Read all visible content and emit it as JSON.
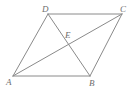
{
  "figure": {
    "kind": "geometry-diagram",
    "background_color": "#ffffff",
    "stroke_color": "#8a8a8a",
    "label_color": "#6e6e6e",
    "stroke_width": 1,
    "width": 135,
    "height": 91
  },
  "points": {
    "A": {
      "label": "A",
      "x": 13,
      "y": 76,
      "label_x": 6,
      "label_y": 78
    },
    "B": {
      "label": "B",
      "x": 90,
      "y": 76,
      "label_x": 89,
      "label_y": 79
    },
    "C": {
      "label": "C",
      "x": 122,
      "y": 14,
      "label_x": 120,
      "label_y": 5
    },
    "D": {
      "label": "D",
      "x": 48,
      "y": 14,
      "label_x": 42,
      "label_y": 5
    },
    "E": {
      "label": "E",
      "x": 65,
      "y": 45,
      "label_x": 65,
      "label_y": 31
    }
  },
  "segments": [
    {
      "name": "side-AB",
      "from": "A",
      "to": "B",
      "x1": 13,
      "y1": 76,
      "x2": 90,
      "y2": 76
    },
    {
      "name": "side-BC",
      "from": "B",
      "to": "C",
      "x1": 90,
      "y1": 76,
      "x2": 122,
      "y2": 14
    },
    {
      "name": "side-CD",
      "from": "C",
      "to": "D",
      "x1": 122,
      "y1": 14,
      "x2": 48,
      "y2": 14
    },
    {
      "name": "side-DA",
      "from": "D",
      "to": "A",
      "x1": 48,
      "y1": 14,
      "x2": 13,
      "y2": 76
    },
    {
      "name": "diagonal-AC",
      "from": "A",
      "to": "C",
      "x1": 13,
      "y1": 76,
      "x2": 122,
      "y2": 14
    },
    {
      "name": "diagonal-DB",
      "from": "D",
      "to": "B",
      "x1": 48,
      "y1": 14,
      "x2": 90,
      "y2": 76
    }
  ]
}
